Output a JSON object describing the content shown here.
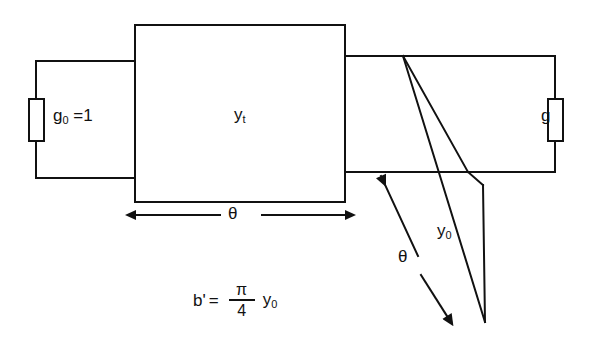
{
  "figure": {
    "type": "circuit-schematic",
    "background_color": "#ffffff",
    "line_color": "#111111"
  },
  "labels": {
    "source_conductance": {
      "base": "g",
      "subscript": "0",
      "suffix": " =1"
    },
    "transmission_block": {
      "base": "y",
      "subscript": "t"
    },
    "load_conductance": {
      "base": "g"
    },
    "width_dimension": {
      "text": "θ"
    },
    "stub_length": {
      "base": "y",
      "subscript": "0"
    },
    "stub_angle": {
      "text": "θ"
    }
  },
  "formula": {
    "lhs": "b'",
    "equals": "=",
    "numerator": "π",
    "denominator": "4",
    "rhs_base": "y",
    "rhs_subscript": "0",
    "plain": "b' = (π/4) y0"
  },
  "elements": {
    "left_resistor": "resistor-vertical",
    "right_resistor": "resistor-vertical",
    "center_block": "rectangle-yt",
    "right_block": "rectangle-load",
    "slanted_stub": "parallelogram-stub",
    "width_arrow": "double-headed-arrow-horizontal",
    "angle_arrow": "double-headed-arrow-diagonal"
  }
}
